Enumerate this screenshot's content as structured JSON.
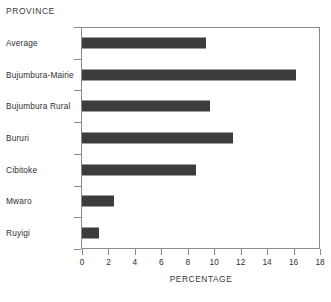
{
  "chart_data": {
    "type": "bar",
    "orientation": "horizontal",
    "title": "",
    "xlabel": "PERCENTAGE",
    "ylabel": "PROVINCE",
    "categories": [
      "Average",
      "Bujumbura-Mairie",
      "Bujumbura Rural",
      "Bururi",
      "Cibitoke",
      "Mwaro",
      "Ruyigi"
    ],
    "values": [
      9.4,
      16.2,
      9.7,
      11.4,
      8.6,
      2.4,
      1.3
    ],
    "xlim": [
      0,
      18
    ],
    "xticks": [
      0,
      2,
      4,
      6,
      8,
      10,
      12,
      14,
      16,
      18
    ],
    "xtick_labels": [
      "0",
      "2",
      "4",
      "6",
      "8",
      "10",
      "12",
      "14",
      "16",
      "18"
    ],
    "grid": false,
    "legend": null,
    "bar_color": "#3c3c3c",
    "axis_color": "#8a8a8a",
    "background": "#ffffff"
  }
}
